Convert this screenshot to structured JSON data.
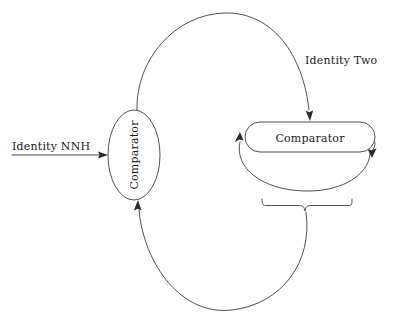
{
  "diagram": {
    "background_color": "#ffffff",
    "stroke_color": "#3b3b3b",
    "text_color": "#1a1a1a",
    "nodes": [
      {
        "id": "left-comparator",
        "label": "Comparator",
        "shape": "ellipse",
        "orientation": "vertical-rotated",
        "cx": 134,
        "cy": 155,
        "rx": 26,
        "ry": 45
      },
      {
        "id": "right-comparator",
        "label": "Comparator",
        "shape": "rounded-rectangle",
        "orientation": "horizontal",
        "x": 245,
        "y": 122,
        "width": 130,
        "height": 30
      }
    ],
    "labels": [
      {
        "id": "input-label",
        "text": "Identity NNH",
        "x": 10,
        "y": 148
      },
      {
        "id": "top-edge-label",
        "text": "Identity Two",
        "x": 305,
        "y": 60
      }
    ],
    "edges": [
      {
        "id": "top-arc",
        "from": "left-comparator",
        "to": "right-comparator",
        "label": "Identity Two",
        "arrow": "down"
      },
      {
        "id": "bottom-arc",
        "from": "brace",
        "to": "left-comparator",
        "label": "",
        "arrow": "up"
      },
      {
        "id": "input-arrow",
        "from": "input-label",
        "to": "left-comparator",
        "label": "Identity NNH",
        "arrow": "right"
      },
      {
        "id": "self-loop",
        "from": "right-comparator",
        "to": "right-comparator",
        "label": "",
        "arrow": "both"
      }
    ],
    "brace": {
      "id": "bottom-brace",
      "x_start": 262,
      "x_end": 352,
      "y": 204,
      "stem_x": 305
    }
  }
}
